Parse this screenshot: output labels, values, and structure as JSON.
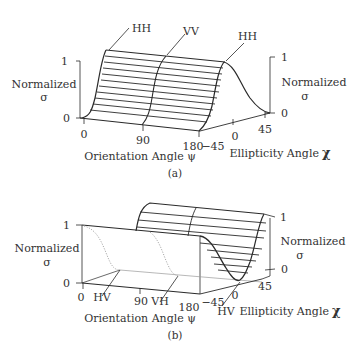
{
  "figure": {
    "panel_a": {
      "label": "(a)",
      "axis_sigma": {
        "label_line1": "Normalized",
        "label_line2": "σ",
        "tick_top": "1",
        "tick_bottom": "0"
      },
      "axis_psi": {
        "label": "Orientation Angle ψ",
        "ticks": [
          "0",
          "90",
          "180"
        ]
      },
      "axis_chi": {
        "label": "Ellipticity Angle",
        "symbol": "χ",
        "ticks": [
          "−45",
          "0",
          "45"
        ]
      },
      "right_sigma": {
        "label_line1": "Normalized",
        "label_line2": "σ",
        "tick_top": "1",
        "tick_bottom": "0"
      },
      "callouts": [
        "HH",
        "VV",
        "HH"
      ]
    },
    "panel_b": {
      "label": "(b)",
      "axis_sigma": {
        "label_line1": "Normalized",
        "label_line2": "σ",
        "tick_top": "1",
        "tick_bottom": "0"
      },
      "axis_psi": {
        "label": "Orientation Angle ψ",
        "ticks": [
          "0",
          "90",
          "180"
        ]
      },
      "axis_chi": {
        "label": "Ellipticity Angle",
        "symbol": "χ",
        "ticks": [
          "−45",
          "0",
          "45"
        ]
      },
      "right_sigma": {
        "label_line1": "Normalized",
        "label_line2": "σ",
        "tick_top": "1",
        "tick_bottom": "0"
      },
      "callouts": [
        "HV",
        "VH",
        "HV"
      ]
    }
  }
}
